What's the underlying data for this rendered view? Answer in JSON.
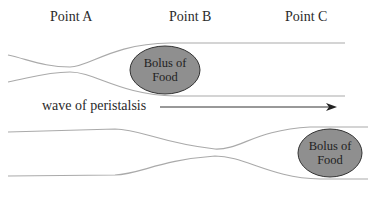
{
  "points": [
    {
      "label": "Point A"
    },
    {
      "label": "Point B"
    },
    {
      "label": "Point C"
    }
  ],
  "bolus_top": {
    "line1": "Bolus of",
    "line2": "Food"
  },
  "bolus_bottom": {
    "line1": "Bolus of",
    "line2": "Food"
  },
  "wave_label": "wave of peristalsis",
  "colors": {
    "tube": "#aaaaaa",
    "bolus_fill": "#8f8f8f",
    "bolus_stroke": "#333333",
    "arrow": "#333333"
  }
}
